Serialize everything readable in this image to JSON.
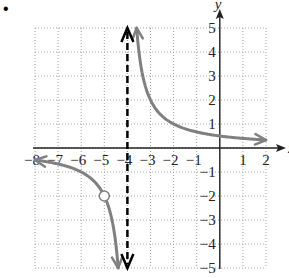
{
  "bullet": "•",
  "chart_data": {
    "type": "line",
    "title": "",
    "xlabel": "x",
    "ylabel": "y",
    "xlim": [
      -8,
      2
    ],
    "ylim": [
      -5,
      5
    ],
    "grid": true,
    "x_ticks": [
      -8,
      -7,
      -6,
      -5,
      -4,
      -3,
      -2,
      -1,
      1,
      2
    ],
    "y_ticks": [
      -5,
      -4,
      -3,
      -2,
      -1,
      1,
      2,
      3,
      4,
      5
    ],
    "x_tick_labels": [
      "−8",
      "−7",
      "−6",
      "−5",
      "−4",
      "−3",
      "−2",
      "−1",
      "1",
      "2"
    ],
    "y_tick_labels": [
      "−5",
      "−4",
      "−3",
      "−2",
      "−1",
      "1",
      "2",
      "3",
      "4",
      "5"
    ],
    "function": "y = 2/(x+4)",
    "vertical_asymptote": -4,
    "horizontal_asymptote": 0,
    "hole": {
      "x": -5,
      "y": -2
    },
    "series": [
      {
        "name": "left-branch",
        "x_range": [
          -8,
          -4.4
        ]
      },
      {
        "name": "right-branch",
        "x_range": [
          -3.6,
          2
        ]
      }
    ],
    "colors": {
      "curve": "#808080",
      "asymptote": "#000000",
      "grid": "#a0a0a0",
      "axis": "#222222"
    }
  }
}
